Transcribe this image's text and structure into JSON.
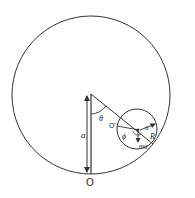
{
  "diagram": {
    "labels": {
      "origin": "O",
      "center_small": "O'",
      "distance": "a",
      "theta": "θ",
      "phi": "ϕ",
      "small_radius": "b",
      "big_radius": "R",
      "weight": "mg"
    },
    "colors": {
      "stroke": "#333333",
      "background": "#ffffff"
    }
  }
}
